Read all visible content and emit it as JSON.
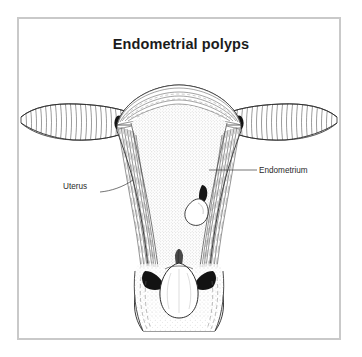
{
  "figure": {
    "title": "Endometrial polyps",
    "frame_color": "#c9c9c9",
    "background_color": "#ffffff",
    "ink_color": "#2b2b2b"
  },
  "labels": [
    {
      "id": "uterus",
      "text": "Uterus",
      "leader": "line from label to left uterine wall"
    },
    {
      "id": "endometrium",
      "text": "Endometrium",
      "leader": "line from label to right endometrial lining"
    }
  ],
  "illustration": {
    "subject": "coronal cross-section of uterus showing endometrial polyps",
    "structures": [
      "fallopian-tube-left",
      "fallopian-tube-right",
      "uterine-fundus",
      "myometrium",
      "endometrial-cavity",
      "polyp-small-intracavitary",
      "polyp-large-prolapsing",
      "cervical-canal",
      "cervix"
    ]
  }
}
